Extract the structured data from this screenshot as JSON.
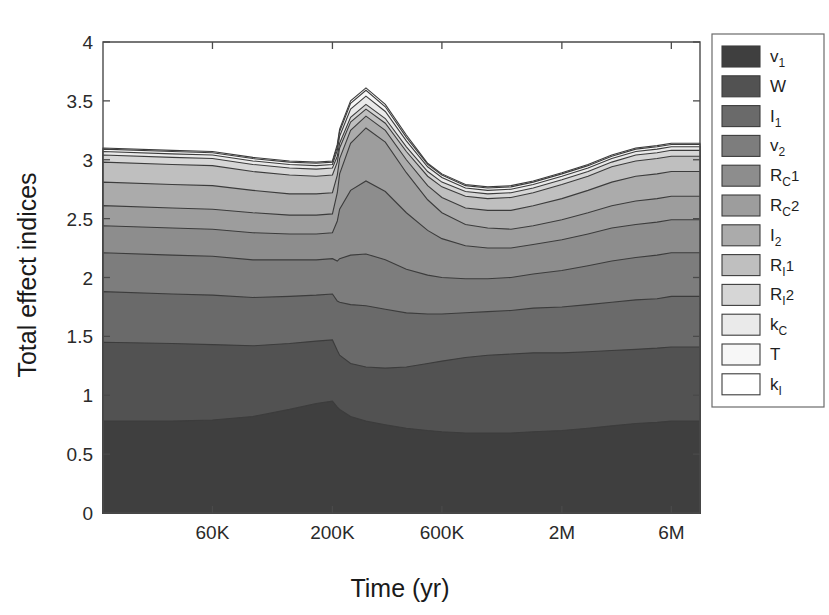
{
  "chart_data": {
    "type": "area",
    "stacked": true,
    "title": "",
    "xlabel": "Time (yr)",
    "ylabel": "Total effect indices",
    "ylim": [
      0,
      4
    ],
    "yticks": [
      "0",
      "0.5",
      "1",
      "1.5",
      "2",
      "2.5",
      "3",
      "3.5",
      "4"
    ],
    "ytick_values": [
      0,
      0.5,
      1,
      1.5,
      2,
      2.5,
      3,
      3.5,
      4
    ],
    "xticks": [
      "60K",
      "200K",
      "600K",
      "2M",
      "6M"
    ],
    "xtick_values": [
      60000,
      200000,
      600000,
      2000000,
      6000000
    ],
    "xscale": "log",
    "grid": false,
    "legend_position": "right-outside",
    "x": [
      20000,
      40000,
      60000,
      90000,
      130000,
      170000,
      200000,
      210000,
      215000,
      240000,
      280000,
      340000,
      420000,
      520000,
      600000,
      760000,
      950000,
      1200000,
      1500000,
      2000000,
      2600000,
      3300000,
      4200000,
      5200000,
      6000000,
      8000000
    ],
    "series": [
      {
        "name": "v1",
        "label": "v",
        "sub": "1",
        "color": "#3f3f3f",
        "values": [
          0.78,
          0.78,
          0.79,
          0.82,
          0.88,
          0.93,
          0.95,
          0.9,
          0.88,
          0.82,
          0.78,
          0.75,
          0.72,
          0.7,
          0.69,
          0.68,
          0.68,
          0.68,
          0.69,
          0.7,
          0.72,
          0.74,
          0.76,
          0.77,
          0.78,
          0.78
        ]
      },
      {
        "name": "W",
        "label": "W",
        "sub": "",
        "color": "#525252",
        "values": [
          0.67,
          0.66,
          0.64,
          0.6,
          0.56,
          0.53,
          0.52,
          0.48,
          0.46,
          0.45,
          0.46,
          0.48,
          0.52,
          0.57,
          0.6,
          0.64,
          0.66,
          0.67,
          0.67,
          0.66,
          0.65,
          0.64,
          0.63,
          0.63,
          0.63,
          0.63
        ]
      },
      {
        "name": "I1",
        "label": "I",
        "sub": "1",
        "color": "#6a6a6a",
        "values": [
          0.43,
          0.42,
          0.42,
          0.41,
          0.4,
          0.39,
          0.39,
          0.42,
          0.45,
          0.5,
          0.52,
          0.5,
          0.46,
          0.42,
          0.4,
          0.38,
          0.37,
          0.37,
          0.38,
          0.39,
          0.4,
          0.41,
          0.42,
          0.42,
          0.43,
          0.43
        ]
      },
      {
        "name": "v2",
        "label": "v",
        "sub": "2",
        "color": "#7d7d7d",
        "values": [
          0.33,
          0.33,
          0.33,
          0.32,
          0.31,
          0.3,
          0.3,
          0.34,
          0.37,
          0.42,
          0.44,
          0.42,
          0.37,
          0.33,
          0.31,
          0.29,
          0.28,
          0.28,
          0.29,
          0.31,
          0.33,
          0.35,
          0.36,
          0.37,
          0.37,
          0.37
        ]
      },
      {
        "name": "RC1",
        "label": "R",
        "sub": "C",
        "sup": "1",
        "color": "#8d8d8d",
        "values": [
          0.23,
          0.23,
          0.23,
          0.23,
          0.22,
          0.22,
          0.22,
          0.34,
          0.42,
          0.55,
          0.62,
          0.58,
          0.48,
          0.38,
          0.33,
          0.28,
          0.26,
          0.25,
          0.25,
          0.26,
          0.27,
          0.28,
          0.28,
          0.28,
          0.28,
          0.28
        ]
      },
      {
        "name": "RC2",
        "label": "R",
        "sub": "C",
        "sup": "2",
        "color": "#9d9d9d",
        "values": [
          0.17,
          0.17,
          0.17,
          0.17,
          0.16,
          0.16,
          0.16,
          0.24,
          0.3,
          0.4,
          0.45,
          0.42,
          0.34,
          0.26,
          0.22,
          0.18,
          0.17,
          0.16,
          0.16,
          0.17,
          0.18,
          0.19,
          0.2,
          0.2,
          0.2,
          0.2
        ]
      },
      {
        "name": "I2",
        "label": "I",
        "sub": "2",
        "color": "#ababab",
        "values": [
          0.2,
          0.2,
          0.2,
          0.19,
          0.18,
          0.18,
          0.18,
          0.15,
          0.13,
          0.11,
          0.1,
          0.1,
          0.11,
          0.12,
          0.13,
          0.14,
          0.15,
          0.16,
          0.17,
          0.18,
          0.19,
          0.2,
          0.21,
          0.21,
          0.21,
          0.21
        ]
      },
      {
        "name": "RI1",
        "label": "R",
        "sub": "I",
        "sup": "1",
        "color": "#bfbfbf",
        "values": [
          0.17,
          0.17,
          0.17,
          0.16,
          0.16,
          0.15,
          0.15,
          0.11,
          0.09,
          0.07,
          0.06,
          0.06,
          0.07,
          0.08,
          0.09,
          0.1,
          0.1,
          0.11,
          0.11,
          0.12,
          0.12,
          0.13,
          0.13,
          0.13,
          0.13,
          0.13
        ]
      },
      {
        "name": "RI2",
        "label": "R",
        "sub": "I",
        "sup": "2",
        "color": "#d6d6d6",
        "values": [
          0.06,
          0.06,
          0.06,
          0.06,
          0.06,
          0.06,
          0.06,
          0.05,
          0.04,
          0.04,
          0.04,
          0.04,
          0.04,
          0.04,
          0.04,
          0.04,
          0.04,
          0.04,
          0.04,
          0.04,
          0.04,
          0.04,
          0.05,
          0.05,
          0.05,
          0.05
        ]
      },
      {
        "name": "kC",
        "label": "k",
        "sub": "C",
        "color": "#eaeaea",
        "values": [
          0.03,
          0.03,
          0.03,
          0.03,
          0.03,
          0.03,
          0.03,
          0.05,
          0.06,
          0.07,
          0.07,
          0.06,
          0.05,
          0.04,
          0.04,
          0.03,
          0.03,
          0.03,
          0.03,
          0.03,
          0.03,
          0.03,
          0.03,
          0.03,
          0.03,
          0.03
        ]
      },
      {
        "name": "T",
        "label": "T",
        "sub": "",
        "color": "#f7f7f7",
        "values": [
          0.02,
          0.02,
          0.02,
          0.02,
          0.02,
          0.02,
          0.02,
          0.03,
          0.04,
          0.05,
          0.05,
          0.04,
          0.03,
          0.02,
          0.02,
          0.02,
          0.02,
          0.02,
          0.02,
          0.02,
          0.02,
          0.02,
          0.02,
          0.02,
          0.02,
          0.02
        ]
      },
      {
        "name": "kI",
        "label": "k",
        "sub": "I",
        "color": "#ffffff",
        "values": [
          0.01,
          0.01,
          0.01,
          0.01,
          0.01,
          0.01,
          0.01,
          0.02,
          0.02,
          0.02,
          0.02,
          0.02,
          0.02,
          0.01,
          0.01,
          0.01,
          0.01,
          0.01,
          0.01,
          0.01,
          0.01,
          0.01,
          0.01,
          0.01,
          0.01,
          0.01
        ]
      }
    ]
  },
  "axes": {
    "ylabel": "Total effect indices",
    "xlabel": "Time (yr)"
  },
  "legend": {
    "entries": [
      {
        "label": "v",
        "sub": "1",
        "sup": "",
        "color": "#3f3f3f"
      },
      {
        "label": "W",
        "sub": "",
        "sup": "",
        "color": "#525252"
      },
      {
        "label": "I",
        "sub": "1",
        "sup": "",
        "color": "#6a6a6a"
      },
      {
        "label": "v",
        "sub": "2",
        "sup": "",
        "color": "#7d7d7d"
      },
      {
        "label": "R",
        "sub": "C",
        "sup": "1",
        "color": "#8d8d8d"
      },
      {
        "label": "R",
        "sub": "C",
        "sup": "2",
        "color": "#9d9d9d"
      },
      {
        "label": "I",
        "sub": "2",
        "sup": "",
        "color": "#ababab"
      },
      {
        "label": "R",
        "sub": "I",
        "sup": "1",
        "color": "#bfbfbf"
      },
      {
        "label": "R",
        "sub": "I",
        "sup": "2",
        "color": "#d6d6d6"
      },
      {
        "label": "k",
        "sub": "C",
        "sup": "",
        "color": "#eaeaea"
      },
      {
        "label": "T",
        "sub": "",
        "sup": "",
        "color": "#f7f7f7"
      },
      {
        "label": "k",
        "sub": "I",
        "sup": "",
        "color": "#ffffff"
      }
    ]
  }
}
